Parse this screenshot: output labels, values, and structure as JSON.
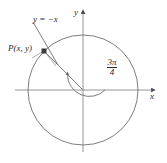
{
  "figure": {
    "background_color": "#ffffff",
    "stroke_color": "#6e6e73",
    "text_color": "#2b2b2b",
    "axes": {
      "x_label": "x",
      "y_label": "y",
      "x_axis_name": "x-axis",
      "y_axis_name": "y-axis"
    },
    "circle": {
      "center_x": 83,
      "center_y": 90,
      "radius": 55
    },
    "line": {
      "equation_label": "y = −x",
      "slope": -1
    },
    "point": {
      "label": "P(x, y)",
      "x_px": 44,
      "y_px": 51,
      "marker": "filled-square"
    },
    "angle": {
      "numerator": "3π",
      "denominator": "4",
      "value_degrees": 135,
      "direction": "counterclockwise",
      "arc_radius": 22
    }
  }
}
